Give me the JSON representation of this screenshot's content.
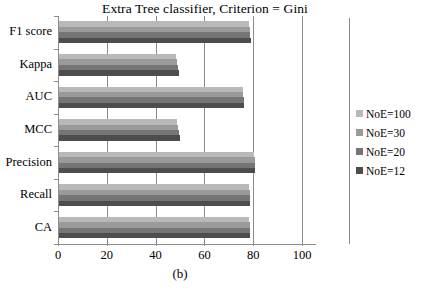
{
  "chart_data": {
    "type": "bar",
    "orientation": "horizontal",
    "title": "Extra Tree classifier, Criterion = Gini",
    "caption": "(b)",
    "xlabel": "",
    "ylabel": "",
    "xlim": [
      0,
      100
    ],
    "xticks": [
      0,
      20,
      40,
      60,
      80,
      100
    ],
    "xtick_labels": [
      "0",
      "20",
      "40",
      "60",
      "80",
      "100"
    ],
    "grid": true,
    "grid_axis": "x",
    "legend_position": "right",
    "categories": [
      "F1 score",
      "Kappa",
      "AUC",
      "MCC",
      "Precision",
      "Recall",
      "CA"
    ],
    "series": [
      {
        "name": "NoE=100",
        "color": "#b9b9b9",
        "values": [
          78.0,
          48.0,
          75.5,
          48.5,
          80.0,
          78.0,
          78.0
        ]
      },
      {
        "name": "NoE=30",
        "color": "#9a9a9a",
        "values": [
          78.2,
          48.3,
          75.6,
          48.8,
          80.2,
          78.2,
          78.1
        ]
      },
      {
        "name": "NoE=20",
        "color": "#757575",
        "values": [
          78.4,
          48.7,
          75.8,
          49.2,
          80.3,
          78.3,
          78.3
        ]
      },
      {
        "name": "NoE=12",
        "color": "#4d4d4d",
        "values": [
          78.5,
          49.0,
          76.0,
          49.5,
          80.4,
          78.4,
          78.4
        ]
      }
    ]
  },
  "legend": {
    "items": [
      {
        "label": "NoE=100",
        "color": "#b9b9b9"
      },
      {
        "label": "NoE=30",
        "color": "#9a9a9a"
      },
      {
        "label": "NoE=20",
        "color": "#757575"
      },
      {
        "label": "NoE=12",
        "color": "#4d4d4d"
      }
    ]
  },
  "colors": {
    "axis": "#8c8c8c",
    "grid": "#8c8c8c",
    "text": "#000000",
    "background": "#ffffff"
  }
}
